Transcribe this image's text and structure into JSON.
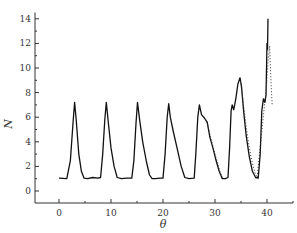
{
  "chart_data": {
    "type": "line",
    "title": "",
    "xlabel": "θ",
    "ylabel": "N",
    "xlim": [
      -5,
      45
    ],
    "ylim": [
      -1,
      15
    ],
    "grid": false,
    "legend": null,
    "x_ticks": [
      0,
      10,
      20,
      30,
      40
    ],
    "x_minor_ticks": [
      5,
      15,
      25,
      35,
      45
    ],
    "y_ticks": [
      0,
      2,
      4,
      6,
      8,
      10,
      12,
      14
    ],
    "y_minor_ticks": [
      1,
      3,
      5,
      7,
      9,
      11,
      13
    ],
    "series": [
      {
        "name": "solid",
        "style": "solid",
        "color": "#111111",
        "points": [
          [
            0.0,
            1.05
          ],
          [
            1.5,
            1.0
          ],
          [
            2.2,
            2.5
          ],
          [
            2.7,
            5.5
          ],
          [
            3.0,
            7.2
          ],
          [
            3.3,
            5.8
          ],
          [
            3.8,
            3.0
          ],
          [
            4.3,
            1.6
          ],
          [
            4.8,
            1.05
          ],
          [
            5.5,
            1.0
          ],
          [
            6.5,
            1.1
          ],
          [
            7.5,
            1.05
          ],
          [
            8.0,
            1.1
          ],
          [
            8.4,
            3.0
          ],
          [
            8.8,
            5.8
          ],
          [
            9.1,
            7.2
          ],
          [
            9.5,
            5.5
          ],
          [
            10.0,
            3.5
          ],
          [
            10.6,
            2.0
          ],
          [
            11.2,
            1.1
          ],
          [
            12.0,
            1.0
          ],
          [
            13.0,
            1.05
          ],
          [
            14.0,
            1.05
          ],
          [
            14.4,
            2.5
          ],
          [
            14.8,
            5.5
          ],
          [
            15.1,
            7.2
          ],
          [
            15.5,
            5.8
          ],
          [
            16.1,
            4.0
          ],
          [
            16.8,
            2.4
          ],
          [
            17.4,
            1.3
          ],
          [
            17.9,
            1.0
          ],
          [
            18.5,
            1.0
          ],
          [
            19.5,
            1.05
          ],
          [
            20.0,
            1.05
          ],
          [
            20.4,
            3.0
          ],
          [
            20.8,
            6.0
          ],
          [
            21.1,
            7.1
          ],
          [
            21.4,
            6.0
          ],
          [
            22.0,
            4.8
          ],
          [
            22.8,
            3.3
          ],
          [
            23.5,
            2.0
          ],
          [
            24.2,
            1.1
          ],
          [
            25.0,
            1.0
          ],
          [
            26.0,
            1.05
          ],
          [
            26.3,
            3.0
          ],
          [
            26.7,
            6.0
          ],
          [
            27.0,
            7.0
          ],
          [
            27.4,
            6.2
          ],
          [
            28.0,
            5.9
          ],
          [
            28.5,
            5.6
          ],
          [
            29.0,
            4.4
          ],
          [
            29.6,
            3.5
          ],
          [
            30.2,
            2.5
          ],
          [
            30.8,
            1.6
          ],
          [
            31.4,
            1.0
          ],
          [
            32.0,
            1.0
          ],
          [
            32.5,
            1.1
          ],
          [
            32.8,
            3.5
          ],
          [
            33.1,
            6.5
          ],
          [
            33.3,
            7.0
          ],
          [
            33.6,
            6.6
          ],
          [
            34.0,
            7.5
          ],
          [
            34.4,
            8.7
          ],
          [
            34.8,
            9.2
          ],
          [
            35.1,
            8.5
          ],
          [
            35.5,
            6.5
          ],
          [
            36.0,
            4.5
          ],
          [
            36.6,
            2.8
          ],
          [
            37.2,
            1.6
          ],
          [
            37.8,
            1.1
          ],
          [
            38.3,
            1.05
          ],
          [
            38.7,
            3.0
          ],
          [
            39.0,
            6.5
          ],
          [
            39.3,
            7.5
          ],
          [
            39.6,
            7.2
          ],
          [
            39.8,
            7.8
          ],
          [
            40.0,
            12.0
          ],
          [
            40.1,
            11.5
          ],
          [
            40.2,
            14.0
          ]
        ]
      },
      {
        "name": "dotted",
        "style": "dotted",
        "color": "#333333",
        "points": [
          [
            27.4,
            6.2
          ],
          [
            28.0,
            6.0
          ],
          [
            28.6,
            5.4
          ],
          [
            29.2,
            4.3
          ],
          [
            29.8,
            3.3
          ],
          [
            30.4,
            2.4
          ],
          [
            31.0,
            1.5
          ],
          [
            31.5,
            1.05
          ],
          [
            34.8,
            9.2
          ],
          [
            35.2,
            8.0
          ],
          [
            35.6,
            6.6
          ],
          [
            36.0,
            5.2
          ],
          [
            36.5,
            3.8
          ],
          [
            37.0,
            2.6
          ],
          [
            37.6,
            1.6
          ],
          [
            38.1,
            1.1
          ],
          [
            39.6,
            7.3
          ],
          [
            39.9,
            8.5
          ],
          [
            40.2,
            10.5
          ],
          [
            40.5,
            11.8
          ],
          [
            40.8,
            8.5
          ],
          [
            41.0,
            7.0
          ]
        ]
      }
    ]
  }
}
